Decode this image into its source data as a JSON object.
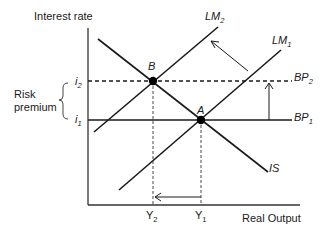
{
  "diagram": {
    "type": "IS-LM-BP",
    "axes": {
      "y_label": "Interest rate",
      "x_label": "Real Output"
    },
    "y_ticks": [
      {
        "base": "i",
        "sub": "2"
      },
      {
        "base": "i",
        "sub": "1"
      }
    ],
    "x_ticks": [
      {
        "base": "Y",
        "sub": "2"
      },
      {
        "base": "Y",
        "sub": "1"
      }
    ],
    "curves": [
      {
        "base": "LM",
        "sub": "2"
      },
      {
        "base": "LM",
        "sub": "1"
      },
      {
        "base": "BP",
        "sub": "2"
      },
      {
        "base": "BP",
        "sub": "1"
      },
      {
        "base": "IS",
        "sub": ""
      }
    ],
    "points": [
      {
        "label": "B"
      },
      {
        "label": "A"
      }
    ],
    "annotation": {
      "line1": "Risk",
      "line2": "premium"
    },
    "colors": {
      "line": "#1a1a1a",
      "background": "#ffffff"
    }
  }
}
